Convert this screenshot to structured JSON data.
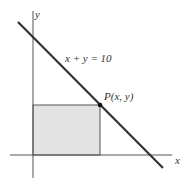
{
  "diagram": {
    "axes": {
      "x_label": "x",
      "y_label": "y"
    },
    "line": {
      "equation_label": "x + y = 10",
      "color": "#333333"
    },
    "point": {
      "label": "P(x, y)",
      "color": "#111111"
    },
    "rectangle": {
      "fill": "#e3e3e3",
      "stroke": "#555555"
    }
  }
}
